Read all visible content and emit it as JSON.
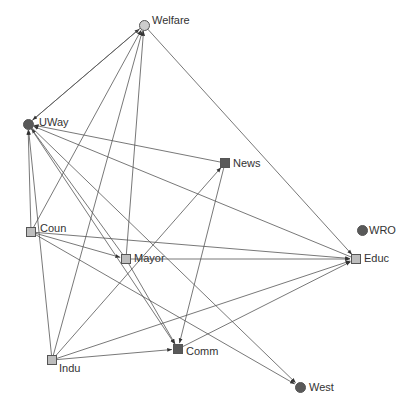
{
  "diagram": {
    "type": "directed-network",
    "nodes": [
      {
        "id": "Welfare",
        "label": "Welfare",
        "x": 144,
        "y": 25,
        "shape": "circle",
        "fill": "#cccccc",
        "lx": 152,
        "ly": 14
      },
      {
        "id": "UWay",
        "label": "UWay",
        "x": 28,
        "y": 124,
        "shape": "circle",
        "fill": "#595959",
        "lx": 39,
        "ly": 116
      },
      {
        "id": "News",
        "label": "News",
        "x": 225,
        "y": 163,
        "shape": "square",
        "fill": "#595959",
        "lx": 233,
        "ly": 157
      },
      {
        "id": "Coun",
        "label": "Coun",
        "x": 31,
        "y": 232,
        "shape": "square",
        "fill": "#bdbdbd",
        "lx": 40,
        "ly": 222
      },
      {
        "id": "Mayor",
        "label": "Mayor",
        "x": 126,
        "y": 259,
        "shape": "square",
        "fill": "#bdbdbd",
        "lx": 134,
        "ly": 252
      },
      {
        "id": "WRO",
        "label": "WRO",
        "x": 362,
        "y": 230,
        "shape": "circle",
        "fill": "#595959",
        "lx": 369,
        "ly": 224
      },
      {
        "id": "Educ",
        "label": "Educ",
        "x": 356,
        "y": 259,
        "shape": "square",
        "fill": "#bdbdbd",
        "lx": 364,
        "ly": 252
      },
      {
        "id": "Indu",
        "label": "Indu",
        "x": 52,
        "y": 360,
        "shape": "square",
        "fill": "#bdbdbd",
        "lx": 59,
        "ly": 362
      },
      {
        "id": "Comm",
        "label": "Comm",
        "x": 178,
        "y": 349,
        "shape": "square",
        "fill": "#595959",
        "lx": 186,
        "ly": 345
      },
      {
        "id": "West",
        "label": "West",
        "x": 300,
        "y": 387,
        "shape": "circle",
        "fill": "#595959",
        "lx": 309,
        "ly": 381
      }
    ],
    "edges": [
      {
        "from": "UWay",
        "to": "Welfare"
      },
      {
        "from": "Welfare",
        "to": "UWay"
      },
      {
        "from": "Coun",
        "to": "Welfare"
      },
      {
        "from": "Indu",
        "to": "Welfare"
      },
      {
        "from": "Mayor",
        "to": "Welfare"
      },
      {
        "from": "Welfare",
        "to": "Educ"
      },
      {
        "from": "News",
        "to": "UWay"
      },
      {
        "from": "Coun",
        "to": "UWay"
      },
      {
        "from": "Indu",
        "to": "UWay"
      },
      {
        "from": "Mayor",
        "to": "UWay"
      },
      {
        "from": "Educ",
        "to": "UWay"
      },
      {
        "from": "UWay",
        "to": "Comm"
      },
      {
        "from": "UWay",
        "to": "West"
      },
      {
        "from": "Indu",
        "to": "News"
      },
      {
        "from": "News",
        "to": "Comm"
      },
      {
        "from": "Coun",
        "to": "Mayor"
      },
      {
        "from": "Coun",
        "to": "Educ"
      },
      {
        "from": "Coun",
        "to": "West"
      },
      {
        "from": "Mayor",
        "to": "Educ"
      },
      {
        "from": "Mayor",
        "to": "Comm"
      },
      {
        "from": "Indu",
        "to": "Comm"
      },
      {
        "from": "Indu",
        "to": "Educ"
      },
      {
        "from": "Comm",
        "to": "Educ"
      }
    ],
    "colors": {
      "edge": "#555555",
      "label": "#333333",
      "node_border": "#555555"
    }
  }
}
